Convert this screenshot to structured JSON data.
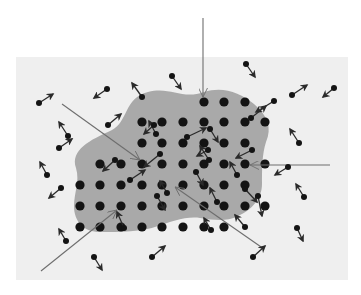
{
  "diagram": {
    "title": "",
    "description": "Crystal lattice (dark dots in gray region) surrounded by free particles with velocity arrows; long lines indicate incoming rays hitting lattice atoms",
    "colors": {
      "page_bg": "#ffffff",
      "panel_bg": "#efefef",
      "region_fill": "#a9a9a9",
      "atom": "#141414",
      "arrow": "#2a2a2a",
      "ray": "#6e6e6e"
    },
    "panel": {
      "x": 16,
      "y": 57,
      "w": 332,
      "h": 223
    },
    "region_path": "M 76 168 C 70 150, 90 140, 112 130 C 128 122, 124 98, 148 92 C 170 86, 182 100, 204 92 C 222 86, 240 92, 254 104 C 268 116, 272 128, 266 142 C 262 154, 262 170, 262 184 C 262 198, 252 210, 238 216 C 226 222, 214 220, 200 218 C 186 216, 170 222, 158 226 C 142 232, 120 232, 100 232 C 84 232, 74 222, 74 206 C 74 192, 80 182, 76 168 Z",
    "lattice": {
      "radius": 4.6,
      "atoms": [
        [
          204,
          102
        ],
        [
          224,
          102
        ],
        [
          245,
          102
        ],
        [
          142,
          122
        ],
        [
          162,
          122
        ],
        [
          183,
          122
        ],
        [
          204,
          122
        ],
        [
          224,
          122
        ],
        [
          245,
          122
        ],
        [
          265,
          122
        ],
        [
          142,
          143
        ],
        [
          162,
          143
        ],
        [
          183,
          143
        ],
        [
          204,
          143
        ],
        [
          224,
          143
        ],
        [
          245,
          143
        ],
        [
          142,
          164
        ],
        [
          162,
          164
        ],
        [
          183,
          164
        ],
        [
          204,
          164
        ],
        [
          224,
          164
        ],
        [
          245,
          164
        ],
        [
          265,
          164
        ],
        [
          100,
          164
        ],
        [
          121,
          164
        ],
        [
          80,
          185
        ],
        [
          100,
          185
        ],
        [
          121,
          185
        ],
        [
          142,
          185
        ],
        [
          162,
          185
        ],
        [
          183,
          185
        ],
        [
          204,
          185
        ],
        [
          224,
          185
        ],
        [
          245,
          185
        ],
        [
          80,
          206
        ],
        [
          100,
          206
        ],
        [
          121,
          206
        ],
        [
          142,
          206
        ],
        [
          162,
          206
        ],
        [
          183,
          206
        ],
        [
          204,
          206
        ],
        [
          224,
          206
        ],
        [
          245,
          206
        ],
        [
          265,
          206
        ],
        [
          80,
          227
        ],
        [
          100,
          227
        ],
        [
          121,
          227
        ],
        [
          142,
          227
        ],
        [
          162,
          227
        ],
        [
          183,
          227
        ],
        [
          204,
          227
        ],
        [
          224,
          227
        ]
      ]
    },
    "free_particles": {
      "radius": 3.0,
      "items": [
        {
          "p": [
            39,
            103
          ],
          "a": [
            53,
            94
          ]
        },
        {
          "p": [
            107,
            89
          ],
          "a": [
            94,
            98
          ]
        },
        {
          "p": [
            142,
            97
          ],
          "a": [
            132,
            83
          ]
        },
        {
          "p": [
            172,
            76
          ],
          "a": [
            181,
            89
          ]
        },
        {
          "p": [
            246,
            64
          ],
          "a": [
            255,
            77
          ]
        },
        {
          "p": [
            292,
            95
          ],
          "a": [
            307,
            85
          ]
        },
        {
          "p": [
            334,
            88
          ],
          "a": [
            323,
            97
          ]
        },
        {
          "p": [
            108,
            125
          ],
          "a": [
            121,
            114
          ]
        },
        {
          "p": [
            68,
            136
          ],
          "a": [
            59,
            122
          ]
        },
        {
          "p": [
            59,
            148
          ],
          "a": [
            72,
            139
          ]
        },
        {
          "p": [
            156,
            134
          ],
          "a": [
            149,
            121
          ]
        },
        {
          "p": [
            154,
            125
          ],
          "a": [
            144,
            134
          ]
        },
        {
          "p": [
            274,
            101
          ],
          "a": [
            256,
            112
          ]
        },
        {
          "p": [
            251,
            118
          ],
          "a": [
            266,
            106
          ]
        },
        {
          "p": [
            187,
            137
          ],
          "a": [
            206,
            128
          ]
        },
        {
          "p": [
            210,
            129
          ],
          "a": [
            218,
            142
          ]
        },
        {
          "p": [
            252,
            150
          ],
          "a": [
            236,
            158
          ]
        },
        {
          "p": [
            209,
            160
          ],
          "a": [
            200,
            146
          ]
        },
        {
          "p": [
            299,
            143
          ],
          "a": [
            290,
            129
          ]
        },
        {
          "p": [
            288,
            167
          ],
          "a": [
            275,
            175
          ]
        },
        {
          "p": [
            160,
            154
          ],
          "a": [
            144,
            167
          ]
        },
        {
          "p": [
            196,
            172
          ],
          "a": [
            203,
            185
          ]
        },
        {
          "p": [
            237,
            175
          ],
          "a": [
            230,
            162
          ]
        },
        {
          "p": [
            115,
            160
          ],
          "a": [
            103,
            171
          ]
        },
        {
          "p": [
            130,
            180
          ],
          "a": [
            145,
            170
          ]
        },
        {
          "p": [
            157,
            196
          ],
          "a": [
            165,
            210
          ]
        },
        {
          "p": [
            167,
            193
          ],
          "a": [
            160,
            181
          ]
        },
        {
          "p": [
            217,
            202
          ],
          "a": [
            210,
            188
          ]
        },
        {
          "p": [
            245,
            189
          ],
          "a": [
            257,
            202
          ]
        },
        {
          "p": [
            61,
            188
          ],
          "a": [
            49,
            198
          ]
        },
        {
          "p": [
            47,
            175
          ],
          "a": [
            40,
            162
          ]
        },
        {
          "p": [
            124,
            228
          ],
          "a": [
            117,
            212
          ]
        },
        {
          "p": [
            258,
            196
          ],
          "a": [
            262,
            216
          ]
        },
        {
          "p": [
            245,
            227
          ],
          "a": [
            235,
            215
          ]
        },
        {
          "p": [
            211,
            230
          ],
          "a": [
            204,
            218
          ]
        },
        {
          "p": [
            297,
            228
          ],
          "a": [
            303,
            241
          ]
        },
        {
          "p": [
            304,
            197
          ],
          "a": [
            296,
            184
          ]
        },
        {
          "p": [
            66,
            241
          ],
          "a": [
            59,
            229
          ]
        },
        {
          "p": [
            94,
            257
          ],
          "a": [
            102,
            270
          ]
        },
        {
          "p": [
            152,
            257
          ],
          "a": [
            165,
            246
          ]
        },
        {
          "p": [
            253,
            257
          ],
          "a": [
            265,
            246
          ]
        },
        {
          "p": [
            208,
            150
          ],
          "a": [
            197,
            156
          ]
        }
      ]
    },
    "rays": [
      {
        "from": [
          203,
          18
        ],
        "to": [
          203,
          97
        ]
      },
      {
        "from": [
          62,
          104
        ],
        "to": [
          140,
          160
        ]
      },
      {
        "from": [
          330,
          165
        ],
        "to": [
          250,
          165
        ]
      },
      {
        "from": [
          41,
          271
        ],
        "to": [
          117,
          210
        ]
      },
      {
        "from": [
          264,
          249
        ],
        "to": [
          175,
          187
        ]
      }
    ]
  }
}
